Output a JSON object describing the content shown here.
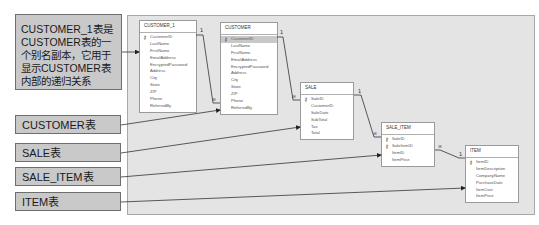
{
  "callouts": {
    "customer_1_note": "CUSTOMER_1表是CUSTOMER表的一个别名副本，它用于显示CUSTOMER表内部的递归关系",
    "customer": "CUSTOMER表",
    "sale": "SALE表",
    "sale_item": "SALE_ITEM表",
    "item": "ITEM表"
  },
  "tables": {
    "customer_1": {
      "title": "CUSTOMER_1",
      "fields": [
        "CustomerID",
        "LastName",
        "FirstName",
        "EmailAddress",
        "EncryptedPassword",
        "Address",
        "City",
        "State",
        "ZIP",
        "Phone",
        "ReferredBy"
      ]
    },
    "customer": {
      "title": "CUSTOMER",
      "fields": [
        "CustomerID",
        "LastName",
        "FirstName",
        "EmailAddress",
        "EncryptedPassword",
        "Address",
        "City",
        "State",
        "ZIP",
        "Phone",
        "ReferredBy"
      ]
    },
    "sale": {
      "title": "SALE",
      "fields": [
        "SaleID",
        "CustomerID",
        "SaleDate",
        "SubTotal",
        "Tax",
        "Total"
      ]
    },
    "sale_item": {
      "title": "SALE_ITEM",
      "fields": [
        "SaleID",
        "SaleItemID",
        "ItemID",
        "ItemPrice"
      ]
    },
    "item": {
      "title": "ITEM",
      "fields": [
        "ItemID",
        "ItemDescription",
        "CompanyName",
        "PurchaseDate",
        "ItemCost",
        "ItemPrice"
      ]
    }
  },
  "relationships": {
    "one_symbol": "1",
    "many_symbol": "∞"
  },
  "icons": {
    "key": "⚷"
  }
}
